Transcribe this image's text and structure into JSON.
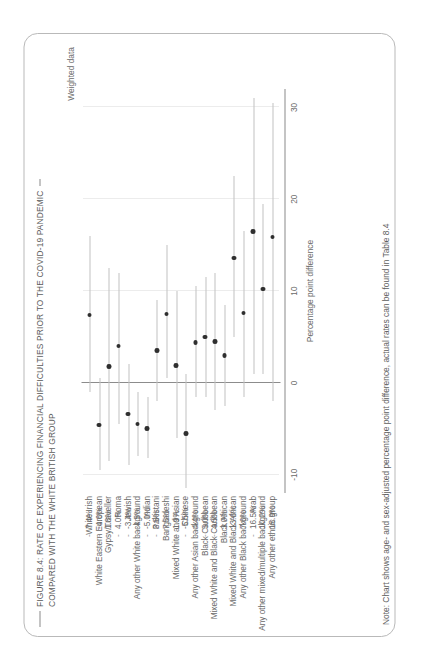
{
  "figure": {
    "title_line1": "FIGURE 8.4: RATE OF EXPERIENCING FINANCIAL DIFFICULTIES PRIOR TO THE COVID-19 PANDEMIC",
    "title_line2": "COMPARED WITH THE WHITE BRITISH GROUP",
    "weighted_label": "Weighted data",
    "note": "Note: Chart shows age- and sex-adjusted percentage point difference, actual rates can be found in Table 8.4"
  },
  "chart_data": {
    "type": "scatter",
    "title": "FIGURE 8.4: RATE OF EXPERIENCING FINANCIAL DIFFICULTIES PRIOR TO THE COVID-19 PANDEMIC COMPARED WITH THE WHITE BRITISH GROUP",
    "xlabel": "Percentage point difference",
    "ylabel": "",
    "xlim": [
      -12,
      32
    ],
    "xticks": [
      -10,
      0,
      10,
      20,
      30
    ],
    "xtick_labels": [
      "-10",
      "0",
      "10",
      "20",
      "30"
    ],
    "grid": true,
    "zero_reference_line": 0,
    "legend": "Weighted data",
    "orientation": "horizontal-dot-with-ci",
    "categories": [
      "White Irish",
      "White Eastern European",
      "Gypsy/Traveller",
      "Roma",
      "Jewish",
      "Any other White background",
      "Indian",
      "Pakistani",
      "Bangladeshi",
      "Mixed White and Asian",
      "Chinese",
      "Any other Asian background",
      "Black Caribbean",
      "Mixed White and Black Caribbean",
      "Black African",
      "Mixed White and Black African",
      "Any other Black background",
      "Arab",
      "Any other mixed/multiple background",
      "Any other ethnic group"
    ],
    "value_labels": [
      "7.4%",
      "-4.6%",
      "1.8%",
      "4.0%",
      "-3.4%",
      "-4.5%",
      "-5.0%",
      "3.5%",
      "7.5%",
      "1.9%",
      "-5.5%",
      "4.4%",
      "5.0%",
      "4.5%",
      "3.0%",
      "13.6%",
      "7.6%",
      "16.5%",
      "10.2%",
      "15.9%"
    ],
    "values": [
      7.4,
      -4.6,
      1.8,
      4.0,
      -3.4,
      -4.5,
      -5.0,
      3.5,
      7.5,
      1.9,
      -5.5,
      4.4,
      5.0,
      4.5,
      3.0,
      13.6,
      7.6,
      16.5,
      10.2,
      15.9
    ],
    "ci_low": [
      -1.0,
      -9.5,
      -8.5,
      -4.5,
      -9.0,
      -8.0,
      -8.2,
      -2.0,
      0.5,
      -6.0,
      -11.5,
      -1.5,
      -1.5,
      -3.0,
      -2.5,
      5.0,
      -1.5,
      1.0,
      1.0,
      -2.0
    ],
    "ci_high": [
      16.0,
      0.5,
      12.5,
      12.0,
      2.0,
      -1.0,
      -1.5,
      9.0,
      15.0,
      10.0,
      1.0,
      10.5,
      11.5,
      12.0,
      8.5,
      22.5,
      16.5,
      31.0,
      19.5,
      30.5
    ]
  }
}
